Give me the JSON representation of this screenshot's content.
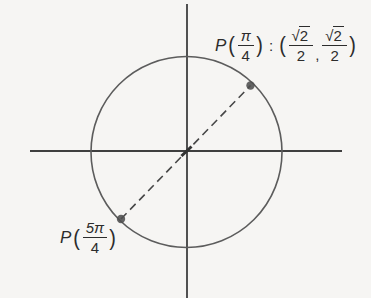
{
  "figure": {
    "colors": {
      "background": "#f6f5f3",
      "axis": "#3f3f3f",
      "circle": "#5c5c5c",
      "dashed_line": "#474747",
      "point": "#4e4e4e",
      "text": "#2c2c2c"
    },
    "points": [
      {
        "label": "P(π/4)",
        "coordinates": "(√2/2, √2/2)",
        "angle": "π/4",
        "position": "upper right of circle"
      },
      {
        "label": "P(5π/4)",
        "angle": "5π/4",
        "position": "lower left of circle"
      }
    ]
  },
  "labels": {
    "p1": {
      "func": "P",
      "lparen": "(",
      "angle_num": "π",
      "angle_den": "4",
      "rparen": ")",
      "colon": ":",
      "coord_lparen": "(",
      "radical": "√",
      "x_radicand": "2",
      "x_den": "2",
      "comma": ",",
      "radical2": "√",
      "y_radicand": "2",
      "y_den": "2",
      "coord_rparen": ")"
    },
    "p2": {
      "func": "P",
      "lparen": "(",
      "angle_num": "5π",
      "angle_den": "4",
      "rparen": ")"
    }
  }
}
